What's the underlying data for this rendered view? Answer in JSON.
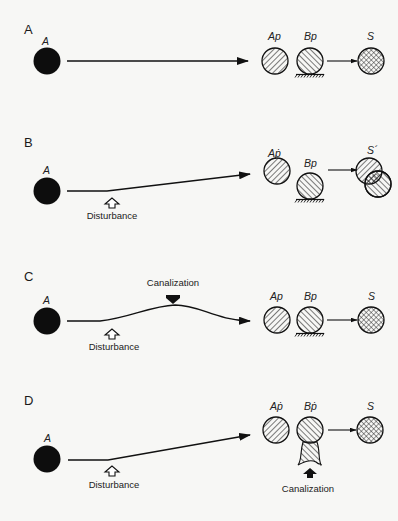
{
  "figure": {
    "panels": [
      {
        "letter": "A",
        "start_label": "A",
        "product_labels": [
          "Ap",
          "Bp"
        ],
        "result_label": "S",
        "annotations": []
      },
      {
        "letter": "B",
        "start_label": "A",
        "product_labels": [
          "Aṗ",
          "Bp"
        ],
        "result_label": "S´",
        "annotations": [
          "Disturbance"
        ]
      },
      {
        "letter": "C",
        "start_label": "A",
        "product_labels": [
          "Ap",
          "Bp"
        ],
        "result_label": "S",
        "annotations": [
          "Canalization",
          "Disturbance"
        ]
      },
      {
        "letter": "D",
        "start_label": "A",
        "product_labels": [
          "Aṗ",
          "Bṗ"
        ],
        "result_label": "S",
        "annotations": [
          "Disturbance",
          "Canalization"
        ]
      }
    ]
  },
  "colors": {
    "background": "#f7f7f5",
    "ink": "#111111"
  }
}
